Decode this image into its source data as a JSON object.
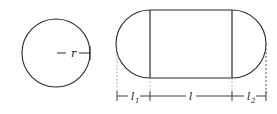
{
  "figure": {
    "background_color": "#ffffff",
    "stroke_color": "#2b2b2b",
    "guide_color": "#8c8c8c",
    "shapes": {
      "circle": {
        "name": "cross-section-circle",
        "center_x": 56,
        "center_y": 53,
        "radius": 34,
        "radius_label": "r",
        "radius_label_x": 73,
        "radius_label_y": 56
      },
      "capsule": {
        "name": "capsule-side-view",
        "left_cap_center_x": 150,
        "right_cap_center_x": 232,
        "center_y": 44,
        "radius": 34,
        "body_left_x": 150,
        "body_right_x": 232
      }
    },
    "dimensions": {
      "baseline_y": 96,
      "left_extent_x": 117,
      "right_extent_x": 266,
      "labels": [
        {
          "name": "dimension-l1",
          "text": "l",
          "subscript": "1",
          "x": 133,
          "y": 99,
          "from_x": 117,
          "to_x": 150
        },
        {
          "name": "dimension-l",
          "text": "l",
          "subscript": "",
          "x": 191,
          "y": 99,
          "from_x": 150,
          "to_x": 232
        },
        {
          "name": "dimension-l2",
          "text": "l",
          "subscript": "2",
          "x": 249,
          "y": 99,
          "from_x": 232,
          "to_x": 266
        }
      ]
    }
  }
}
